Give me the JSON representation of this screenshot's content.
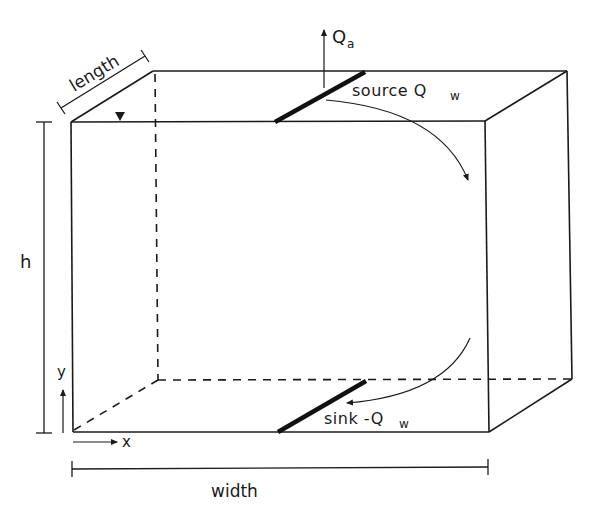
{
  "diagram": {
    "type": "3D box schematic of aquifer/reservoir block",
    "colors": {
      "ink": "#1a1a1a",
      "background": "#ffffff"
    },
    "labels": {
      "length": "length",
      "height": "h",
      "width": "width",
      "x_axis": "x",
      "y_axis": "y",
      "air_flux_symbol": "Q",
      "air_flux_subscript": "a",
      "source_prefix": "source Q",
      "source_subscript": "w",
      "sink_prefix": "sink -Q",
      "sink_subscript": "w"
    },
    "symbols": {
      "water_table": "water-table-triangle",
      "air_flux_arrow": "arrow-up",
      "flow_arrows": [
        "curved-arrow-down",
        "curved-arrow-down-left"
      ]
    },
    "elements": [
      "box front face (solid)",
      "box top face (solid)",
      "box right face (solid)",
      "hidden back edges (dashed)",
      "source line on top face (thick)",
      "sink line on bottom face (thick)",
      "dimension lines: length, h, width",
      "axis arrows x and y at origin"
    ]
  }
}
